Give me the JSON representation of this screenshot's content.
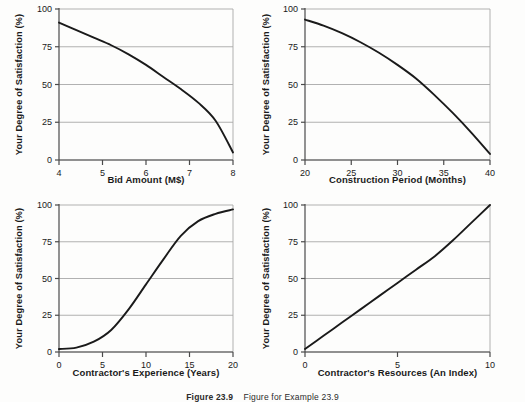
{
  "figure": {
    "caption_label": "Figure 23.9",
    "caption_body": "Figure for Example 23.9",
    "background_color": "#fdfdfc",
    "curve_color": "#1a1a1a",
    "grid_color": "#a8a8a8",
    "axis_color": "#4a4a4a"
  },
  "shared": {
    "ylabel": "Your Degree of Satisfaction (%)",
    "y_ticks": [
      "0",
      "25",
      "50",
      "75",
      "100"
    ]
  },
  "chart_data": [
    {
      "type": "line",
      "title": "",
      "panel": "top-left",
      "xlabel": "Bid Amount (M$)",
      "ylabel": "Your Degree of Satisfaction (%)",
      "xlim": [
        4,
        8
      ],
      "ylim": [
        0,
        100
      ],
      "xticks": [
        4,
        5,
        6,
        7,
        8
      ],
      "xtick_labels": [
        "4",
        "5",
        "6",
        "7",
        "8"
      ],
      "yticks": [
        0,
        25,
        50,
        75,
        100
      ],
      "ytick_labels": [
        "0",
        "25",
        "50",
        "75",
        "100"
      ],
      "grid": "horizontal",
      "legend": "none",
      "x": [
        4.0,
        4.4,
        4.8,
        5.2,
        5.6,
        6.0,
        6.4,
        6.8,
        7.2,
        7.6,
        8.0
      ],
      "y": [
        91,
        86,
        81,
        76,
        70,
        63,
        55,
        47,
        38,
        26,
        5
      ]
    },
    {
      "type": "line",
      "title": "",
      "panel": "top-right",
      "xlabel": "Construction Period (Months)",
      "ylabel": "Your Degree of Satisfaction (%)",
      "xlim": [
        20,
        40
      ],
      "ylim": [
        0,
        100
      ],
      "xticks": [
        20,
        25,
        30,
        35,
        40
      ],
      "xtick_labels": [
        "20",
        "25",
        "30",
        "35",
        "40"
      ],
      "yticks": [
        0,
        25,
        50,
        75,
        100
      ],
      "ytick_labels": [
        "0",
        "25",
        "50",
        "75",
        "100"
      ],
      "grid": "horizontal",
      "legend": "none",
      "x": [
        20,
        22,
        24,
        26,
        28,
        30,
        32,
        34,
        36,
        38,
        40
      ],
      "y": [
        93,
        89,
        84,
        78,
        71,
        63,
        54,
        43,
        31,
        18,
        4
      ]
    },
    {
      "type": "line",
      "title": "",
      "panel": "bottom-left",
      "xlabel": "Contractor's Experience (Years)",
      "ylabel": "Your Degree of Satisfaction (%)",
      "xlim": [
        0,
        20
      ],
      "ylim": [
        0,
        100
      ],
      "xticks": [
        0,
        5,
        10,
        15,
        20
      ],
      "xtick_labels": [
        "0",
        "5",
        "10",
        "15",
        "20"
      ],
      "yticks": [
        0,
        25,
        50,
        75,
        100
      ],
      "ytick_labels": [
        "0",
        "25",
        "50",
        "75",
        "100"
      ],
      "grid": "horizontal",
      "legend": "none",
      "x": [
        0,
        2,
        4,
        6,
        8,
        10,
        12,
        14,
        16,
        18,
        20
      ],
      "y": [
        2,
        3,
        7,
        15,
        29,
        46,
        63,
        79,
        89,
        94,
        97
      ]
    },
    {
      "type": "line",
      "title": "",
      "panel": "bottom-right",
      "xlabel": "Contractor's Resources (An Index)",
      "ylabel": "Your Degree of Satisfaction (%)",
      "xlim": [
        0,
        10
      ],
      "ylim": [
        0,
        100
      ],
      "xticks": [
        0,
        5,
        10
      ],
      "xtick_labels": [
        "0",
        "5",
        "10"
      ],
      "yticks": [
        0,
        25,
        50,
        75,
        100
      ],
      "ytick_labels": [
        "0",
        "25",
        "50",
        "75",
        "100"
      ],
      "grid": "horizontal",
      "legend": "none",
      "x": [
        0,
        1,
        2,
        3,
        4,
        5,
        6,
        7,
        8,
        9,
        10
      ],
      "y": [
        2,
        11,
        20,
        29,
        38,
        47,
        56,
        65,
        76,
        88,
        100
      ]
    }
  ]
}
